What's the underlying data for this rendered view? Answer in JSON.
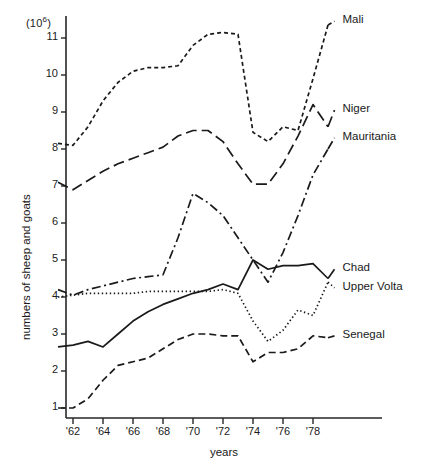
{
  "chart_data": {
    "type": "line",
    "title": "",
    "xlabel": "years",
    "ylabel": "numbers of sheep and goats",
    "yunit": "(10⁶)",
    "xlim": [
      1961,
      1979.5
    ],
    "ylim": [
      0.55,
      11.6
    ],
    "grid": false,
    "legend_position": "right-end-labels",
    "ytick_labels": [
      "11",
      "10",
      "9",
      "8",
      "7",
      "6",
      "5",
      "4",
      "3",
      "2",
      "1"
    ],
    "ytick_values": [
      11,
      10,
      9,
      8,
      7,
      6,
      5,
      4,
      3,
      2,
      1
    ],
    "xtick_labels": [
      "'62",
      "'64",
      "'66",
      "'68",
      "'70",
      "'72",
      "'74",
      "'76",
      "'78"
    ],
    "xtick_values": [
      1962,
      1964,
      1966,
      1968,
      1970,
      1972,
      1974,
      1976,
      1978
    ],
    "x": [
      1961,
      1962,
      1963,
      1964,
      1965,
      1966,
      1967,
      1968,
      1969,
      1970,
      1971,
      1972,
      1973,
      1974,
      1975,
      1976,
      1977,
      1978,
      1979
    ],
    "series": [
      {
        "name": "Mali",
        "style": "short-dash",
        "color": "#1a1a1a",
        "label_x": 1979.7,
        "label_y": 11.45,
        "values": [
          8.15,
          8.1,
          8.6,
          9.3,
          9.8,
          10.1,
          10.2,
          10.2,
          10.25,
          10.8,
          11.1,
          11.15,
          11.1,
          8.45,
          8.2,
          8.6,
          8.5,
          9.9,
          11.35
        ]
      },
      {
        "name": "Niger",
        "style": "long-dash",
        "color": "#1a1a1a",
        "label_x": 1979.7,
        "label_y": 9.05,
        "values": [
          7.1,
          6.9,
          7.15,
          7.4,
          7.6,
          7.75,
          7.9,
          8.05,
          8.35,
          8.5,
          8.5,
          8.2,
          7.6,
          7.05,
          7.05,
          7.6,
          8.35,
          9.2,
          8.6
        ]
      },
      {
        "name": "Mauritania",
        "style": "dash-dot",
        "color": "#1a1a1a",
        "label_x": 1979.7,
        "label_y": 8.3,
        "values": [
          4.2,
          4.05,
          4.2,
          4.3,
          4.4,
          4.5,
          4.55,
          4.6,
          5.6,
          6.8,
          6.55,
          6.2,
          5.6,
          5.0,
          4.4,
          5.2,
          6.2,
          7.3,
          8.0
        ]
      },
      {
        "name": "Chad",
        "style": "solid",
        "color": "#1a1a1a",
        "label_x": 1979.7,
        "label_y": 4.75,
        "values": [
          2.65,
          2.7,
          2.8,
          2.65,
          3.0,
          3.35,
          3.6,
          3.8,
          3.95,
          4.1,
          4.2,
          4.35,
          4.2,
          5.0,
          4.75,
          4.85,
          4.85,
          4.9,
          4.5
        ]
      },
      {
        "name": "Upper Volta",
        "style": "dotted",
        "color": "#1a1a1a",
        "label_x": 1979.7,
        "label_y": 4.25,
        "values": [
          4.0,
          4.05,
          4.1,
          4.1,
          4.1,
          4.1,
          4.15,
          4.15,
          4.15,
          4.15,
          4.15,
          4.2,
          4.1,
          3.35,
          2.8,
          3.1,
          3.65,
          3.5,
          4.4
        ]
      },
      {
        "name": "Senegal",
        "style": "medium-dash",
        "color": "#1a1a1a",
        "label_x": 1979.7,
        "label_y": 2.95,
        "values": [
          1.0,
          1.0,
          1.25,
          1.75,
          2.15,
          2.25,
          2.35,
          2.6,
          2.85,
          3.0,
          3.0,
          2.95,
          2.95,
          2.25,
          2.5,
          2.5,
          2.6,
          2.95,
          2.9
        ]
      }
    ]
  }
}
